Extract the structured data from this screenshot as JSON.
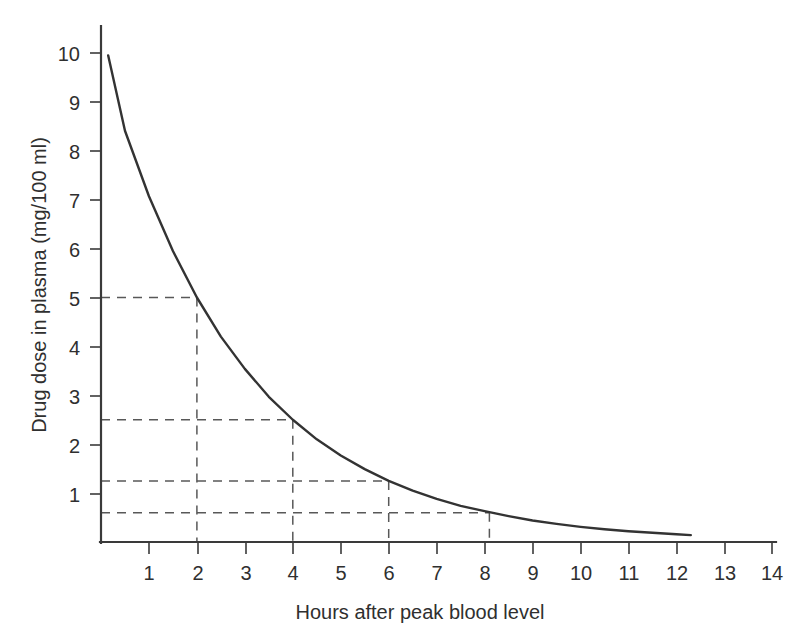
{
  "chart_data": {
    "type": "line",
    "title": "",
    "subtitle": "",
    "xlabel": "Hours after peak blood level",
    "ylabel": "Drug dose in plasma (mg/100 ml)",
    "xlim": [
      0,
      14.2
    ],
    "ylim": [
      0,
      10.6
    ],
    "grid": false,
    "legend": "none",
    "x_ticks": [
      1,
      2,
      3,
      4,
      5,
      6,
      7,
      8,
      9,
      10,
      11,
      12,
      13,
      14
    ],
    "x_tick_labels": [
      "1",
      "2",
      "3",
      "4",
      "5",
      "6",
      "7",
      "8",
      "9",
      "10",
      "11",
      "12",
      "13",
      "14"
    ],
    "y_ticks": [
      1,
      2,
      3,
      4,
      5,
      6,
      7,
      8,
      9,
      10
    ],
    "y_tick_labels": [
      "1",
      "2",
      "3",
      "4",
      "5",
      "6",
      "7",
      "8",
      "9",
      "10"
    ],
    "series": [
      {
        "name": "Drug dose decay",
        "color": "#333333",
        "style": "solid",
        "half_life_hours": 2,
        "x": [
          0.15,
          0.5,
          1.0,
          1.5,
          2.0,
          2.5,
          3.0,
          3.5,
          4.0,
          4.5,
          5.0,
          5.5,
          6.0,
          6.5,
          7.0,
          7.5,
          8.0,
          8.5,
          9.0,
          9.5,
          10.0,
          10.5,
          11.0,
          11.5,
          12.0,
          12.3
        ],
        "y": [
          9.95,
          8.41,
          7.07,
          5.95,
          5.0,
          4.2,
          3.54,
          2.97,
          2.5,
          2.1,
          1.77,
          1.49,
          1.25,
          1.05,
          0.88,
          0.74,
          0.63,
          0.53,
          0.44,
          0.37,
          0.31,
          0.26,
          0.22,
          0.19,
          0.16,
          0.14
        ]
      }
    ],
    "annotations": [
      {
        "type": "guide",
        "label": "2 h -> 5 mg",
        "x": 2.0,
        "y": 5.0
      },
      {
        "type": "guide",
        "label": "4 h -> 2.5 mg",
        "x": 4.0,
        "y": 2.5
      },
      {
        "type": "guide",
        "label": "6 h -> 1.25 mg",
        "x": 6.0,
        "y": 1.25
      },
      {
        "type": "guide",
        "label": "8.1 h -> 0.6 mg",
        "x": 8.1,
        "y": 0.6
      }
    ],
    "guide_style": {
      "color": "#585858",
      "dash": "dashed"
    }
  },
  "axes": {
    "y_title": "Drug dose in plasma (mg/100 ml)",
    "x_title": "Hours after peak blood level"
  },
  "colors": {
    "curve": "#333333",
    "axis": "#3a3a3a",
    "guide": "#585858",
    "text": "#2f2f2f",
    "background": "#ffffff"
  }
}
